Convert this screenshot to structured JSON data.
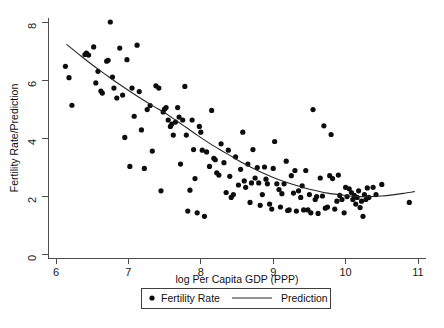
{
  "chart_data": {
    "type": "scatter",
    "title": "",
    "xlabel": "log Per Capita GDP (PPP)",
    "ylabel": "Fertility Rate/Prediction",
    "xlim": [
      5.85,
      11.1
    ],
    "ylim": [
      -0.2,
      8.35
    ],
    "xticks": [
      6,
      7,
      8,
      9,
      10,
      11
    ],
    "xticklabels": [
      "6",
      "7",
      "8",
      "9",
      "10",
      "11"
    ],
    "yticks": [
      0,
      2,
      4,
      6,
      8
    ],
    "yticklabels": [
      "0",
      "2",
      "4",
      "6",
      "8"
    ],
    "grid": false,
    "legend_position": "below-axis-center",
    "series": [
      {
        "name": "Fertility Rate",
        "type": "scatter",
        "marker": "filled-circle",
        "color": "#0d0d0d",
        "points": [
          [
            6.13,
            6.47
          ],
          [
            6.18,
            6.08
          ],
          [
            6.22,
            5.13
          ],
          [
            6.4,
            6.88
          ],
          [
            6.42,
            6.93
          ],
          [
            6.45,
            6.86
          ],
          [
            6.52,
            7.14
          ],
          [
            6.55,
            5.9
          ],
          [
            6.58,
            6.3
          ],
          [
            6.62,
            5.62
          ],
          [
            6.64,
            5.55
          ],
          [
            6.7,
            6.65
          ],
          [
            6.72,
            6.68
          ],
          [
            6.75,
            8.0
          ],
          [
            6.78,
            6.1
          ],
          [
            6.8,
            5.72
          ],
          [
            6.84,
            5.38
          ],
          [
            6.88,
            7.1
          ],
          [
            6.92,
            5.48
          ],
          [
            6.95,
            4.02
          ],
          [
            6.98,
            6.7
          ],
          [
            7.02,
            3.02
          ],
          [
            7.05,
            5.72
          ],
          [
            7.08,
            4.75
          ],
          [
            7.12,
            7.2
          ],
          [
            7.15,
            5.6
          ],
          [
            7.18,
            4.28
          ],
          [
            7.22,
            2.95
          ],
          [
            7.26,
            4.98
          ],
          [
            7.3,
            5.12
          ],
          [
            7.33,
            3.55
          ],
          [
            7.38,
            5.8
          ],
          [
            7.42,
            5.72
          ],
          [
            7.45,
            2.18
          ],
          [
            7.48,
            4.9
          ],
          [
            7.5,
            5.0
          ],
          [
            7.52,
            5.05
          ],
          [
            7.55,
            4.62
          ],
          [
            7.58,
            4.4
          ],
          [
            7.6,
            4.48
          ],
          [
            7.62,
            4.1
          ],
          [
            7.65,
            4.55
          ],
          [
            7.68,
            5.05
          ],
          [
            7.7,
            4.72
          ],
          [
            7.72,
            3.1
          ],
          [
            7.75,
            4.62
          ],
          [
            7.78,
            5.78
          ],
          [
            7.8,
            4.1
          ],
          [
            7.82,
            1.48
          ],
          [
            7.85,
            2.2
          ],
          [
            7.88,
            4.62
          ],
          [
            7.9,
            3.6
          ],
          [
            7.92,
            2.6
          ],
          [
            7.95,
            1.42
          ],
          [
            7.98,
            4.4
          ],
          [
            8.0,
            4.2
          ],
          [
            8.02,
            3.58
          ],
          [
            8.05,
            1.3
          ],
          [
            8.08,
            3.52
          ],
          [
            8.12,
            3.02
          ],
          [
            8.15,
            4.95
          ],
          [
            8.18,
            3.3
          ],
          [
            8.2,
            3.25
          ],
          [
            8.22,
            2.8
          ],
          [
            8.25,
            2.72
          ],
          [
            8.28,
            3.8
          ],
          [
            8.32,
            3.15
          ],
          [
            8.35,
            2.12
          ],
          [
            8.38,
            3.58
          ],
          [
            8.4,
            2.68
          ],
          [
            8.42,
            1.95
          ],
          [
            8.45,
            2.05
          ],
          [
            8.48,
            3.35
          ],
          [
            8.52,
            2.38
          ],
          [
            8.55,
            2.92
          ],
          [
            8.58,
            4.2
          ],
          [
            8.6,
            2.52
          ],
          [
            8.62,
            2.3
          ],
          [
            8.65,
            3.1
          ],
          [
            8.68,
            1.78
          ],
          [
            8.7,
            2.45
          ],
          [
            8.72,
            3.6
          ],
          [
            8.75,
            2.62
          ],
          [
            8.78,
            2.98
          ],
          [
            8.8,
            2.45
          ],
          [
            8.82,
            1.68
          ],
          [
            8.85,
            2.05
          ],
          [
            8.88,
            3.0
          ],
          [
            8.9,
            2.58
          ],
          [
            8.92,
            2.42
          ],
          [
            8.95,
            1.72
          ],
          [
            8.98,
            1.55
          ],
          [
            9.0,
            2.95
          ],
          [
            9.02,
            3.88
          ],
          [
            9.05,
            2.42
          ],
          [
            9.08,
            2.22
          ],
          [
            9.1,
            1.62
          ],
          [
            9.12,
            2.08
          ],
          [
            9.15,
            2.42
          ],
          [
            9.18,
            3.2
          ],
          [
            9.2,
            1.5
          ],
          [
            9.22,
            1.52
          ],
          [
            9.25,
            2.7
          ],
          [
            9.28,
            2.1
          ],
          [
            9.3,
            2.88
          ],
          [
            9.32,
            1.48
          ],
          [
            9.35,
            2.18
          ],
          [
            9.38,
            1.95
          ],
          [
            9.4,
            2.35
          ],
          [
            9.42,
            1.52
          ],
          [
            9.45,
            2.88
          ],
          [
            9.48,
            1.52
          ],
          [
            9.5,
            2.05
          ],
          [
            9.52,
            1.42
          ],
          [
            9.55,
            4.98
          ],
          [
            9.58,
            1.88
          ],
          [
            9.6,
            1.98
          ],
          [
            9.62,
            1.4
          ],
          [
            9.65,
            2.62
          ],
          [
            9.68,
            2.0
          ],
          [
            9.7,
            4.42
          ],
          [
            9.72,
            1.58
          ],
          [
            9.75,
            1.62
          ],
          [
            9.78,
            2.7
          ],
          [
            9.8,
            4.12
          ],
          [
            9.82,
            2.6
          ],
          [
            9.85,
            1.55
          ],
          [
            9.88,
            1.82
          ],
          [
            9.9,
            2.72
          ],
          [
            9.92,
            2.02
          ],
          [
            9.95,
            1.88
          ],
          [
            9.98,
            1.42
          ],
          [
            10.0,
            2.3
          ],
          [
            10.02,
            1.98
          ],
          [
            10.05,
            2.25
          ],
          [
            10.08,
            2.12
          ],
          [
            10.1,
            1.88
          ],
          [
            10.12,
            2.02
          ],
          [
            10.14,
            1.72
          ],
          [
            10.16,
            1.95
          ],
          [
            10.18,
            2.18
          ],
          [
            10.2,
            1.6
          ],
          [
            10.22,
            1.82
          ],
          [
            10.24,
            1.3
          ],
          [
            10.26,
            2.05
          ],
          [
            10.28,
            1.88
          ],
          [
            10.3,
            2.28
          ],
          [
            10.32,
            1.95
          ],
          [
            10.38,
            2.3
          ],
          [
            10.42,
            2.05
          ],
          [
            10.5,
            2.4
          ],
          [
            10.88,
            1.78
          ]
        ]
      },
      {
        "name": "Prediction",
        "type": "line",
        "color": "#262626",
        "points": [
          [
            6.15,
            7.22
          ],
          [
            6.3,
            6.92
          ],
          [
            6.45,
            6.62
          ],
          [
            6.6,
            6.34
          ],
          [
            6.75,
            6.07
          ],
          [
            6.9,
            5.81
          ],
          [
            7.05,
            5.56
          ],
          [
            7.2,
            5.32
          ],
          [
            7.35,
            5.09
          ],
          [
            7.5,
            4.87
          ],
          [
            7.65,
            4.62
          ],
          [
            7.8,
            4.36
          ],
          [
            7.95,
            4.1
          ],
          [
            8.1,
            3.85
          ],
          [
            8.25,
            3.62
          ],
          [
            8.4,
            3.4
          ],
          [
            8.55,
            3.18
          ],
          [
            8.7,
            2.98
          ],
          [
            8.85,
            2.8
          ],
          [
            9.0,
            2.64
          ],
          [
            9.15,
            2.5
          ],
          [
            9.3,
            2.38
          ],
          [
            9.45,
            2.27
          ],
          [
            9.6,
            2.18
          ],
          [
            9.75,
            2.1
          ],
          [
            9.9,
            2.05
          ],
          [
            10.05,
            2.0
          ],
          [
            10.2,
            1.98
          ],
          [
            10.35,
            1.98
          ],
          [
            10.5,
            2.0
          ],
          [
            10.65,
            2.04
          ],
          [
            10.8,
            2.09
          ],
          [
            10.95,
            2.15
          ]
        ]
      }
    ]
  },
  "legend": {
    "marker_label": "Fertility Rate",
    "line_label": "Prediction"
  }
}
